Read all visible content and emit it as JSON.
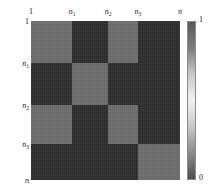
{
  "chart_data": {
    "type": "heatmap",
    "title": "",
    "xlabel": "",
    "ylabel": "",
    "grid": false,
    "legend_position": "right",
    "block_rows": 4,
    "block_cols": 4,
    "block_row_fractions": [
      0.2642,
      0.2642,
      0.2453,
      0.2263
    ],
    "block_col_fractions": [
      0.2752,
      0.2416,
      0.2013,
      0.2819
    ],
    "value_high": 0.55,
    "value_low": 0.18,
    "matrix": [
      [
        0.55,
        0.18,
        0.55,
        0.18
      ],
      [
        0.18,
        0.55,
        0.18,
        0.18
      ],
      [
        0.55,
        0.18,
        0.55,
        0.18
      ],
      [
        0.18,
        0.18,
        0.18,
        0.55
      ]
    ],
    "colors": {
      "high": "#6e6e6e",
      "low": "#2e2e2e"
    },
    "colorbar": {
      "label_max": "1",
      "label_min": "0",
      "range": [
        0,
        1
      ],
      "stops": [
        "#585858",
        "#7d7d7d",
        "#c8c8c8",
        "#f2f2f2",
        "#c8c8c8",
        "#8a8a8a",
        "#4f4f4f"
      ]
    },
    "x_axis": {
      "position": "top",
      "ticks": [
        {
          "label": "1",
          "italic": false,
          "sub": "",
          "pos_frac": 0.0
        },
        {
          "label": "n",
          "italic": true,
          "sub": "1",
          "pos_frac": 0.2752
        },
        {
          "label": "n",
          "italic": true,
          "sub": "2",
          "pos_frac": 0.5168
        },
        {
          "label": "n",
          "italic": true,
          "sub": "3",
          "pos_frac": 0.7181
        },
        {
          "label": "n",
          "italic": true,
          "sub": "",
          "pos_frac": 1.0
        }
      ]
    },
    "y_axis": {
      "position": "left",
      "ticks": [
        {
          "label": "1",
          "italic": false,
          "sub": "",
          "pos_frac": 0.0
        },
        {
          "label": "n",
          "italic": true,
          "sub": "1",
          "pos_frac": 0.2642
        },
        {
          "label": "n",
          "italic": true,
          "sub": "2",
          "pos_frac": 0.5283
        },
        {
          "label": "n",
          "italic": true,
          "sub": "3",
          "pos_frac": 0.7736
        },
        {
          "label": "n",
          "italic": true,
          "sub": "",
          "pos_frac": 1.0
        }
      ]
    }
  }
}
